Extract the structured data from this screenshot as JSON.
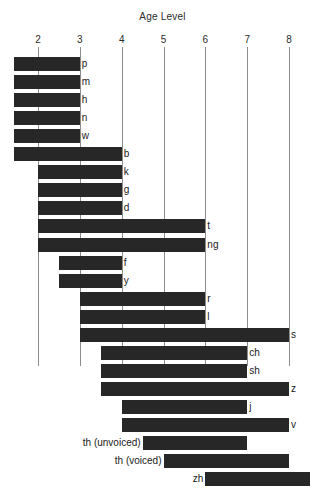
{
  "chart_data": {
    "type": "bar",
    "orientation": "horizontal",
    "title": "Age Level",
    "xlabel": "",
    "ylabel": "",
    "xlim": [
      1.4,
      8.5
    ],
    "grid": true,
    "legend": null,
    "xticks": [
      2,
      3,
      4,
      5,
      6,
      7,
      8
    ],
    "xtick_labels": [
      "2",
      "3",
      "4",
      "5",
      "6",
      "7",
      "8"
    ],
    "bar_color": "#272727",
    "categories": [
      "p",
      "m",
      "h",
      "n",
      "w",
      "b",
      "k",
      "g",
      "d",
      "t",
      "ng",
      "f",
      "y",
      "r",
      "l",
      "s",
      "ch",
      "sh",
      "z",
      "j",
      "v",
      "th (unvoiced)",
      "th (voiced)",
      "zh"
    ],
    "bars": [
      {
        "label": "p",
        "start": 1.43,
        "end": 3.0,
        "label_side": "right"
      },
      {
        "label": "m",
        "start": 1.43,
        "end": 3.0,
        "label_side": "right"
      },
      {
        "label": "h",
        "start": 1.43,
        "end": 3.0,
        "label_side": "right"
      },
      {
        "label": "n",
        "start": 1.43,
        "end": 3.0,
        "label_side": "right"
      },
      {
        "label": "w",
        "start": 1.43,
        "end": 3.0,
        "label_side": "right"
      },
      {
        "label": "b",
        "start": 1.43,
        "end": 4.0,
        "label_side": "right"
      },
      {
        "label": "k",
        "start": 2.0,
        "end": 4.0,
        "label_side": "right"
      },
      {
        "label": "g",
        "start": 2.0,
        "end": 4.0,
        "label_side": "right"
      },
      {
        "label": "d",
        "start": 2.0,
        "end": 4.0,
        "label_side": "right"
      },
      {
        "label": "t",
        "start": 2.0,
        "end": 6.0,
        "label_side": "right"
      },
      {
        "label": "ng",
        "start": 2.0,
        "end": 6.0,
        "label_side": "right"
      },
      {
        "label": "f",
        "start": 2.5,
        "end": 4.0,
        "label_side": "right"
      },
      {
        "label": "y",
        "start": 2.5,
        "end": 4.0,
        "label_side": "right"
      },
      {
        "label": "r",
        "start": 3.0,
        "end": 6.0,
        "label_side": "right"
      },
      {
        "label": "l",
        "start": 3.0,
        "end": 6.0,
        "label_side": "right"
      },
      {
        "label": "s",
        "start": 3.0,
        "end": 8.0,
        "label_side": "right"
      },
      {
        "label": "ch",
        "start": 3.5,
        "end": 7.0,
        "label_side": "right"
      },
      {
        "label": "sh",
        "start": 3.5,
        "end": 7.0,
        "label_side": "right"
      },
      {
        "label": "z",
        "start": 3.5,
        "end": 8.0,
        "label_side": "right"
      },
      {
        "label": "j",
        "start": 4.0,
        "end": 7.0,
        "label_side": "right"
      },
      {
        "label": "v",
        "start": 4.0,
        "end": 8.0,
        "label_side": "right"
      },
      {
        "label": "th (unvoiced)",
        "start": 4.5,
        "end": 7.0,
        "label_side": "left"
      },
      {
        "label": "th (voiced)",
        "start": 5.0,
        "end": 8.0,
        "label_side": "left"
      },
      {
        "label": "zh",
        "start": 6.0,
        "end": 8.5,
        "label_side": "left"
      }
    ]
  }
}
